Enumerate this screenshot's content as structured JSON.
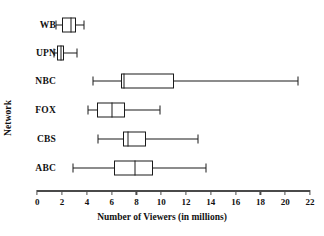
{
  "chart_data": {
    "type": "box",
    "title": "",
    "xlabel": "Number of Viewers (in millions)",
    "ylabel": "Network",
    "xlim": [
      0,
      22
    ],
    "xtick_step": 2,
    "xticks": [
      0,
      2,
      4,
      6,
      8,
      10,
      12,
      14,
      16,
      18,
      20,
      22
    ],
    "xticklabels": [
      "0",
      "2",
      "4",
      "6",
      "8",
      "10",
      "12",
      "14",
      "16",
      "18",
      "20",
      "22"
    ],
    "grid": false,
    "legend": null,
    "orientation": "horizontal",
    "categories": [
      "WB",
      "UPN",
      "NBC",
      "FOX",
      "CBS",
      "ABC"
    ],
    "boxes": [
      {
        "category": "WB",
        "whisker_low": 1.5,
        "q1": 2.0,
        "median": 2.7,
        "q3": 3.1,
        "whisker_high": 3.8
      },
      {
        "category": "UPN",
        "whisker_low": 1.35,
        "q1": 1.6,
        "median": 1.9,
        "q3": 2.15,
        "whisker_high": 3.2
      },
      {
        "category": "NBC",
        "whisker_low": 4.5,
        "q1": 6.75,
        "median": 7.0,
        "q3": 11.0,
        "whisker_high": 21.0
      },
      {
        "category": "FOX",
        "whisker_low": 4.05,
        "q1": 4.8,
        "median": 6.05,
        "q3": 7.1,
        "whisker_high": 9.9
      },
      {
        "category": "CBS",
        "whisker_low": 4.9,
        "q1": 6.9,
        "median": 7.3,
        "q3": 8.75,
        "whisker_high": 13.0
      },
      {
        "category": "ABC",
        "whisker_low": 2.85,
        "q1": 6.15,
        "median": 7.85,
        "q3": 9.35,
        "whisker_high": 13.6
      }
    ],
    "colors": {
      "line": "#1a1a1a",
      "axis": "#4a4a4a",
      "box_fill": "#ffffff",
      "text": "#111111",
      "background": "#ffffff"
    }
  }
}
